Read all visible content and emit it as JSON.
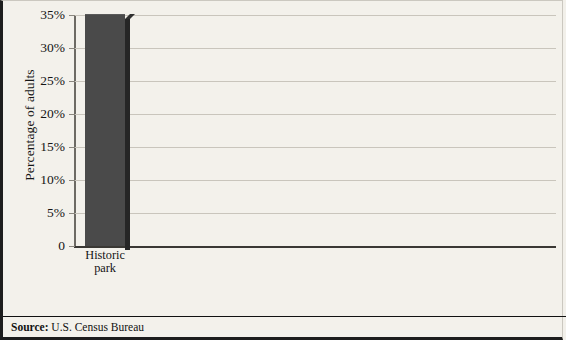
{
  "figure": {
    "ylabel": "Percentage of adults",
    "source_label": "Source:",
    "source_text": "U.S. Census Bureau"
  },
  "chart_data": {
    "type": "bar",
    "title": "",
    "subtitle": "",
    "xlabel": "",
    "ylabel": "Percentage of adults",
    "ylim": [
      0,
      35
    ],
    "grid": true,
    "legend": null,
    "yticks": [
      0,
      5,
      10,
      15,
      20,
      25,
      30,
      35
    ],
    "ytick_labels": [
      "0",
      "5%",
      "10%",
      "15%",
      "20%",
      "25%",
      "30%",
      "35%"
    ],
    "categories": [
      "Historic\npark",
      "Art\nmuseum",
      "Musical\nplay",
      "Non-\nmusical\nplay",
      "Classical\nmusic\nperformance",
      "Jazz\nperformance",
      "Ballet",
      "Opera"
    ],
    "category_lines": [
      [
        "Historic",
        "park"
      ],
      [
        "Art",
        "museum"
      ],
      [
        "Musical",
        "play"
      ],
      [
        "Non-",
        "musical",
        "play"
      ],
      [
        "Classical",
        "music",
        "performance"
      ],
      [
        "Jazz",
        "performance"
      ],
      [
        "Ballet"
      ],
      [
        "Opera"
      ]
    ],
    "values": [
      35,
      34,
      24.3,
      16.3,
      16.3,
      11.9,
      5.9,
      4.9
    ],
    "bar_color": "#4a4a4a",
    "bar_shadow_color": "#262626",
    "background_color": "#f3f1eb",
    "grid_color": "#c9c5bc",
    "icons": [
      "cannon-icon",
      "picture-frame-icon",
      "music-notes-icon",
      "theater-masks-icon",
      "grand-piano-icon",
      "trumpet-icon",
      "ballet-shoes-icon",
      "viking-helmet-icon"
    ]
  }
}
